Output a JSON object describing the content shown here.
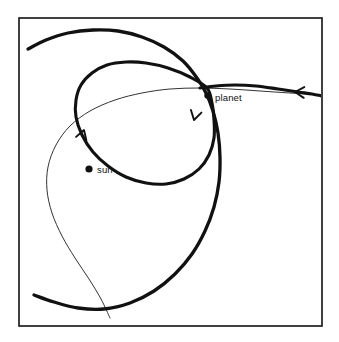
{
  "figure": {
    "background_color": "#ffffff",
    "ink_color": "#111111",
    "frame": {
      "name": "plot-frame",
      "x": 19,
      "y": 18,
      "width": 303,
      "height": 308,
      "stroke_width": 1.6
    },
    "labels": {
      "sun": "sun",
      "planet": "planet"
    },
    "markers": {
      "sun": {
        "cx": 89,
        "cy": 169,
        "r": 3.6
      },
      "planet": {
        "cx": 207.5,
        "cy": 95.5,
        "r": 3.2
      }
    },
    "label_positions": {
      "sun": {
        "x": 97,
        "y": 173
      },
      "planet": {
        "x": 215,
        "y": 101
      }
    }
  },
  "chart_data": {
    "type": "line",
    "xlabel": "",
    "ylabel": "",
    "grid": false,
    "legend": "none",
    "annotations": [
      {
        "text": "sun",
        "x": 89,
        "y": 169,
        "marker": "filled-dot"
      },
      {
        "text": "planet",
        "x": 207.5,
        "y": 95.5,
        "marker": "filled-dot"
      }
    ],
    "series": [
      {
        "name": "planet-elliptical-orbit",
        "style": "thick-solid",
        "stroke_width": 3.1,
        "closed": true,
        "description": "Inner ellipse: the planet's orbit around the sun, tilted with major axis running from lower-left to upper-right",
        "points": [
          [
            207,
            88
          ],
          [
            190,
            77
          ],
          [
            168,
            68
          ],
          [
            146,
            63
          ],
          [
            126,
            62
          ],
          [
            107,
            65
          ],
          [
            92,
            73
          ],
          [
            81,
            85
          ],
          [
            76,
            100
          ],
          [
            76,
            117
          ],
          [
            82,
            135
          ],
          [
            93,
            152
          ],
          [
            108,
            166
          ],
          [
            126,
            177
          ],
          [
            146,
            183
          ],
          [
            166,
            184
          ],
          [
            184,
            179
          ],
          [
            199,
            169
          ],
          [
            209,
            155
          ],
          [
            214,
            138
          ],
          [
            214,
            120
          ],
          [
            212,
            103
          ],
          [
            207,
            88
          ]
        ]
      },
      {
        "name": "incoming-hyperbolic-approach",
        "style": "thin-solid",
        "stroke_width": 1.0,
        "closed": false,
        "description": "Thin large-radius trajectory sweeping from the right edge, past the sun on the upper-left, and exiting at the bottom",
        "points": [
          [
            322,
            95
          ],
          [
            290,
            93
          ],
          [
            260,
            91
          ],
          [
            230,
            89
          ],
          [
            200,
            88
          ],
          [
            170,
            89
          ],
          [
            142,
            93
          ],
          [
            115,
            100
          ],
          [
            90,
            111
          ],
          [
            70,
            126
          ],
          [
            56,
            145
          ],
          [
            48,
            167
          ],
          [
            47,
            190
          ],
          [
            52,
            213
          ],
          [
            62,
            236
          ],
          [
            75,
            258
          ],
          [
            89,
            279
          ],
          [
            101,
            299
          ],
          [
            110,
            318
          ]
        ]
      },
      {
        "name": "outer-capture-curve",
        "style": "thick-solid",
        "stroke_width": 3.3,
        "closed": false,
        "description": "Thick outer trajectory arcing in from the upper-left, crossing near the planet, then sweeping down and around to the lower-left",
        "points": [
          [
            28,
            49
          ],
          [
            46,
            40
          ],
          [
            68,
            33
          ],
          [
            93,
            30
          ],
          [
            118,
            31
          ],
          [
            142,
            37
          ],
          [
            164,
            47
          ],
          [
            183,
            61
          ],
          [
            197,
            78
          ],
          [
            206,
            93
          ],
          [
            213,
            111
          ],
          [
            218,
            133
          ],
          [
            220,
            157
          ],
          [
            219,
            182
          ],
          [
            214,
            207
          ],
          [
            205,
            231
          ],
          [
            192,
            254
          ],
          [
            175,
            274
          ],
          [
            154,
            291
          ],
          [
            130,
            303
          ],
          [
            104,
            309
          ],
          [
            78,
            308
          ],
          [
            54,
            302
          ],
          [
            34,
            295
          ]
        ]
      },
      {
        "name": "outgoing-escape-branch",
        "style": "thick-solid",
        "stroke_width": 3.1,
        "closed": false,
        "description": "Thick branch leaving the planet crossing point toward the right edge of the frame",
        "points": [
          [
            200,
            88
          ],
          [
            216,
            86
          ],
          [
            235,
            85
          ],
          [
            256,
            86
          ],
          [
            278,
            89
          ],
          [
            298,
            92
          ],
          [
            312,
            94
          ],
          [
            322,
            96
          ]
        ]
      }
    ],
    "direction_arrows": [
      {
        "name": "arrow-orbit-ascending",
        "x": 84,
        "y": 130,
        "angle_deg": -72,
        "description": "Arrow on the left flank of the ellipse pointing up, showing counter-clockwise orbital motion"
      },
      {
        "name": "arrow-orbit-descending",
        "x": 194,
        "y": 120,
        "angle_deg": 104,
        "description": "Arrow on the right flank of the ellipse pointing down"
      },
      {
        "name": "arrow-incoming-trajectory",
        "x": 295,
        "y": 92,
        "angle_deg": 183,
        "description": "Arrow on the right-edge trajectory pointing left, indicating the inbound direction"
      }
    ]
  }
}
